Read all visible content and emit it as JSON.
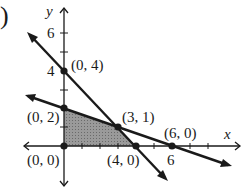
{
  "figure": {
    "part_label": ")",
    "axes": {
      "x_label": "x",
      "y_label": "y",
      "x_tick_labels": [
        {
          "value": 6,
          "text": "6"
        }
      ],
      "y_tick_labels": [
        {
          "value": 4,
          "text": "4"
        },
        {
          "value": 6,
          "text": "6"
        }
      ]
    },
    "lines": [
      {
        "name": "line-through-0-4-and-4-0",
        "equation": "x + y = 4"
      },
      {
        "name": "line-through-0-2-and-6-0",
        "equation": "x + 3y = 6"
      }
    ],
    "points": [
      {
        "x": 0,
        "y": 4,
        "label": "(0, 4)"
      },
      {
        "x": 0,
        "y": 2,
        "label": "(0, 2)"
      },
      {
        "x": 3,
        "y": 1,
        "label": "(3, 1)"
      },
      {
        "x": 6,
        "y": 0,
        "label": "(6, 0)"
      },
      {
        "x": 0,
        "y": 0,
        "label": "(0, 0)"
      },
      {
        "x": 4,
        "y": 0,
        "label": "(4, 0)"
      }
    ],
    "shaded_region": {
      "vertices": [
        "(0, 0)",
        "(0, 2)",
        "(3, 1)",
        "(4, 0)"
      ],
      "color": "#8c8c8c"
    },
    "colors": {
      "ink": "#1a1a1a",
      "shade": "#8c8c8c"
    }
  }
}
